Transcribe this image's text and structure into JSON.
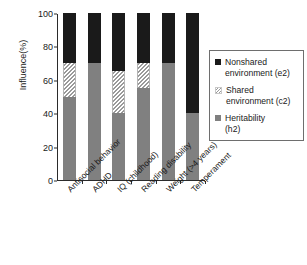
{
  "chart_data": {
    "type": "bar",
    "subtype": "stacked-bar-100",
    "title": "",
    "xlabel": "",
    "ylabel": "Influence(%)",
    "ylim": [
      0,
      100
    ],
    "yticks": [
      0,
      20,
      40,
      60,
      80,
      100
    ],
    "grid": false,
    "legend_position": "right",
    "categories": [
      "Antisocial behavior",
      "ADHD",
      "IQ (childhood)",
      "Reading disability",
      "Weight (>4 years)",
      "Temperament"
    ],
    "series": [
      {
        "name": "Heritability (h2)",
        "key": "h2",
        "color": "#808080",
        "fill": "solid-gray",
        "values": [
          50,
          70,
          40,
          55,
          70,
          40
        ]
      },
      {
        "name": "Shared environment (c2)",
        "key": "c2",
        "color": "#9a9a9a",
        "fill": "diagonal-hatch",
        "values": [
          20,
          0,
          25,
          15,
          0,
          0
        ]
      },
      {
        "name": "Nonshared environment (e2)",
        "key": "e2",
        "color": "#1a1a1a",
        "fill": "solid-black",
        "values": [
          30,
          30,
          35,
          30,
          30,
          60
        ]
      }
    ],
    "stack_order_bottom_to_top": [
      "h2",
      "c2",
      "e2"
    ]
  },
  "axes": {
    "y_title": "Influence(%)",
    "y_tick_labels": [
      "0",
      "20",
      "40",
      "60",
      "80",
      "100"
    ],
    "x_tick_labels": [
      "Antisocial behavior",
      "ADHD",
      "IQ (childhood)",
      "Reading disability",
      "Weight (>4 years)",
      "Temperament"
    ]
  },
  "legend": {
    "entries": [
      {
        "swatch": "black-square-icon",
        "line1": "Nonshared",
        "line2": "environment (e2)"
      },
      {
        "swatch": "hatched-square-icon",
        "line1": "Shared",
        "line2": "environment (c2)"
      },
      {
        "swatch": "gray-square-icon",
        "line1": "Heritability",
        "line2": "(h2)"
      }
    ]
  }
}
